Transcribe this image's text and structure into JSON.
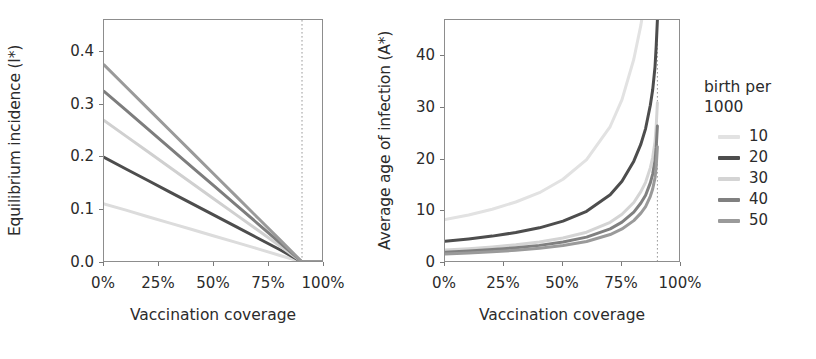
{
  "chart_data": [
    {
      "panel": "left",
      "type": "line",
      "title": "",
      "xlabel": "Vaccination coverage",
      "ylabel": "Equilibrium incidence (I*)",
      "xlim": [
        0,
        100
      ],
      "ylim": [
        0.0,
        0.46
      ],
      "xticks": [
        "0%",
        "25%",
        "50%",
        "75%",
        "100%"
      ],
      "xtick_values": [
        0,
        25,
        50,
        75,
        100
      ],
      "yticks": [
        "0.0",
        "0.1",
        "0.2",
        "0.3",
        "0.4"
      ],
      "ytick_values": [
        0.0,
        0.1,
        0.2,
        0.3,
        0.4
      ],
      "grid": false,
      "legend": "right",
      "annotations": [
        {
          "name": "elimination-threshold",
          "type": "vline",
          "x": 90,
          "style": "dotted"
        }
      ],
      "x": [
        0,
        10,
        20,
        30,
        40,
        50,
        60,
        70,
        80,
        90,
        100
      ],
      "series": [
        {
          "name": "10",
          "color": "#dcdcdc",
          "values": [
            0.112,
            0.1,
            0.0875,
            0.0755,
            0.0635,
            0.0512,
            0.039,
            0.0268,
            0.0142,
            0.002,
            0.002
          ]
        },
        {
          "name": "20",
          "color": "#4d4d4d",
          "values": [
            0.2,
            0.178,
            0.1562,
            0.1343,
            0.1125,
            0.0906,
            0.0688,
            0.0469,
            0.025,
            0.002,
            0.002
          ]
        },
        {
          "name": "30",
          "color": "#d0d0d0",
          "values": [
            0.27,
            0.2402,
            0.2105,
            0.1808,
            0.1511,
            0.1213,
            0.0916,
            0.0619,
            0.0321,
            0.002,
            0.002
          ]
        },
        {
          "name": "40",
          "color": "#7d7d7d",
          "values": [
            0.325,
            0.2892,
            0.2533,
            0.2175,
            0.1817,
            0.1458,
            0.11,
            0.0742,
            0.0383,
            0.002,
            0.002
          ]
        },
        {
          "name": "50",
          "color": "#9a9a9a",
          "values": [
            0.375,
            0.3336,
            0.2922,
            0.2508,
            0.2094,
            0.168,
            0.1266,
            0.0852,
            0.0438,
            0.002,
            0.002
          ]
        }
      ]
    },
    {
      "panel": "right",
      "type": "line",
      "title": "",
      "xlabel": "Vaccination coverage",
      "ylabel": "Average age of infection (A*)",
      "xlim": [
        0,
        100
      ],
      "ylim": [
        0,
        47
      ],
      "xticks": [
        "0%",
        "25%",
        "50%",
        "75%",
        "100%"
      ],
      "xtick_values": [
        0,
        25,
        50,
        75,
        100
      ],
      "yticks": [
        "0",
        "10",
        "20",
        "30",
        "40"
      ],
      "ytick_values": [
        0,
        10,
        20,
        30,
        40
      ],
      "grid": false,
      "annotations": [
        {
          "name": "elimination-threshold",
          "type": "vline",
          "x": 90,
          "style": "dotted"
        }
      ],
      "x": [
        0,
        10,
        20,
        30,
        40,
        50,
        60,
        70,
        75,
        80,
        83,
        85,
        87,
        88,
        89,
        89.5,
        90
      ],
      "series": [
        {
          "name": "10",
          "color": "#e2e2e2",
          "values": [
            8.4,
            9.3,
            10.4,
            11.8,
            13.6,
            16.2,
            20.0,
            26.4,
            31.6,
            39.4,
            46.0,
            52.0,
            60.0,
            65.0,
            71.0,
            75.0,
            80.0
          ]
        },
        {
          "name": "20",
          "color": "#4d4d4d",
          "values": [
            4.2,
            4.65,
            5.2,
            5.9,
            6.8,
            8.1,
            10.0,
            13.2,
            15.8,
            19.7,
            23.0,
            26.0,
            30.5,
            33.5,
            38.0,
            42.0,
            47.0
          ]
        },
        {
          "name": "30",
          "color": "#d4d4d4",
          "values": [
            2.5,
            2.77,
            3.1,
            3.52,
            4.06,
            4.83,
            5.96,
            7.87,
            9.42,
            11.7,
            13.8,
            15.6,
            18.4,
            20.4,
            23.5,
            26.5,
            31.0
          ]
        },
        {
          "name": "40",
          "color": "#808080",
          "values": [
            2.1,
            2.33,
            2.6,
            2.96,
            3.41,
            4.06,
            5.0,
            6.6,
            7.9,
            9.85,
            11.6,
            13.1,
            15.5,
            17.2,
            19.8,
            22.4,
            26.5
          ]
        },
        {
          "name": "50",
          "color": "#9a9a9a",
          "values": [
            1.75,
            1.94,
            2.17,
            2.46,
            2.84,
            3.38,
            4.17,
            5.5,
            6.58,
            8.2,
            9.65,
            10.9,
            12.9,
            14.3,
            16.5,
            18.7,
            22.5
          ]
        }
      ]
    }
  ],
  "legend": {
    "title_line1": "birth per",
    "title_line2": "1000",
    "items": [
      {
        "label": "10",
        "color": "#e2e2e2"
      },
      {
        "label": "20",
        "color": "#4d4d4d"
      },
      {
        "label": "30",
        "color": "#d4d4d4"
      },
      {
        "label": "40",
        "color": "#808080"
      },
      {
        "label": "50",
        "color": "#9a9a9a"
      }
    ]
  },
  "style": {
    "axis_color": "#8d8d8d",
    "text_color": "#2b2b2b",
    "background": "#ffffff",
    "vline_color": "#9a9a9a"
  }
}
